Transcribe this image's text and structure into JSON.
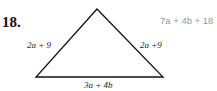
{
  "problem": {
    "number": "18.",
    "answer": "7a + 4b + 18",
    "sides": {
      "left": "2a + 9",
      "right": "2a +9",
      "bottom": "3a + 4b"
    }
  },
  "colors": {
    "answer": "#9a9a9a",
    "lines": "#111111"
  }
}
